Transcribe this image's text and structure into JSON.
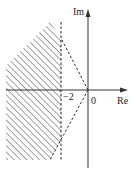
{
  "diagram": {
    "type": "complex-plane-region",
    "axes": {
      "x_label": "Re",
      "y_label": "Im",
      "origin_label": "0"
    },
    "markers": [
      {
        "label": "−2",
        "value": -2
      }
    ],
    "region": {
      "description": "Hatched stability region left of Re = -2 bounded by dashed rays from origin",
      "hatch": "diagonal"
    },
    "colors": {
      "line": "#333333",
      "hatch": "#555555",
      "background": "#ffffff"
    }
  }
}
